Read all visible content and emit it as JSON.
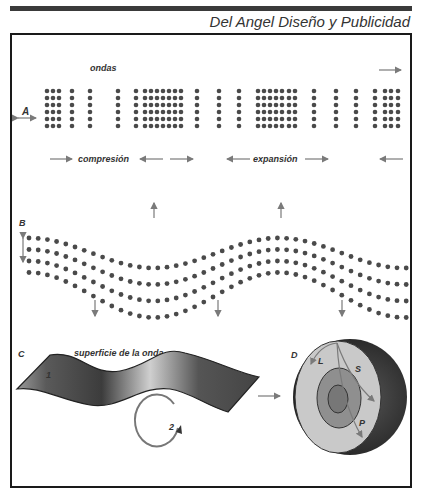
{
  "header": {
    "credit": "Del Angel Diseño y Publicidad"
  },
  "panels": {
    "A": {
      "letter": "A",
      "title": "ondas",
      "compression_label": "compresión",
      "expansion_label": "expansión"
    },
    "B": {
      "letter": "B"
    },
    "C": {
      "letter": "C",
      "title": "superficie de la onda",
      "marker_1": "1",
      "marker_2": "2"
    },
    "D": {
      "letter": "D",
      "wave_L": "L",
      "wave_S": "S",
      "wave_P": "P"
    }
  },
  "colors": {
    "dot": "#4a4a4a",
    "arrow": "#7a7a7a",
    "frame": "#1a1a1a",
    "core_outer": "#c9c9c9",
    "core_mid": "#8f8f8f",
    "core_inner": "#777777",
    "crust": "#3a3a3a"
  }
}
